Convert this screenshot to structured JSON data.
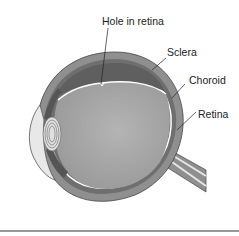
{
  "diagram": {
    "labels": {
      "hole": "Hole in retina",
      "sclera": "Sclera",
      "choroid": "Choroid",
      "retina": "Retina"
    },
    "colors": {
      "sclera": "#8f8f8f",
      "choroid": "#6f6f6f",
      "retina_line": "#ffffff",
      "vitreous": "#a8a8a8",
      "fluid_pocket": "#6a6a6a",
      "lens": "#d8d8d8",
      "cornea_space": "#e8e8e8",
      "leader": "#222222"
    }
  }
}
